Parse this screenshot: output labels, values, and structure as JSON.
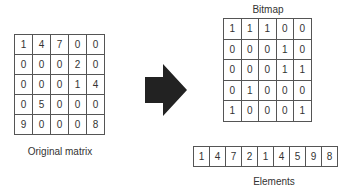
{
  "original_matrix": {
    "label": "Original matrix",
    "rows": [
      [
        "1",
        "4",
        "7",
        "0",
        "0"
      ],
      [
        "0",
        "0",
        "0",
        "2",
        "0"
      ],
      [
        "0",
        "0",
        "0",
        "1",
        "4"
      ],
      [
        "0",
        "5",
        "0",
        "0",
        "0"
      ],
      [
        "9",
        "0",
        "0",
        "0",
        "8"
      ]
    ]
  },
  "bitmap": {
    "label": "Bitmap",
    "rows": [
      [
        "1",
        "1",
        "1",
        "0",
        "0"
      ],
      [
        "0",
        "0",
        "0",
        "1",
        "0"
      ],
      [
        "0",
        "0",
        "0",
        "1",
        "1"
      ],
      [
        "0",
        "1",
        "0",
        "0",
        "0"
      ],
      [
        "1",
        "0",
        "0",
        "0",
        "1"
      ]
    ]
  },
  "elements": {
    "label": "Elements",
    "values": [
      "1",
      "4",
      "7",
      "2",
      "1",
      "4",
      "5",
      "9",
      "8"
    ]
  },
  "arrow": {
    "icon": "right-arrow-icon",
    "color": "#222222"
  }
}
